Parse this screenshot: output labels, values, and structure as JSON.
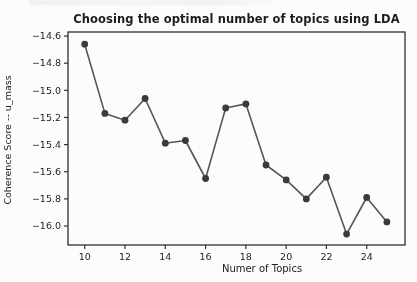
{
  "chart_data": {
    "type": "line",
    "title": "Choosing the optimal number of topics using LDA",
    "xlabel": "Numer of Topics",
    "ylabel": "Coherence Score -- u_mass",
    "x": [
      10,
      11,
      12,
      13,
      14,
      15,
      16,
      17,
      18,
      19,
      20,
      21,
      22,
      23,
      24,
      25
    ],
    "values": [
      -14.66,
      -15.17,
      -15.22,
      -15.06,
      -15.39,
      -15.37,
      -15.65,
      -15.13,
      -15.1,
      -15.55,
      -15.66,
      -15.8,
      -15.64,
      -16.06,
      -15.79,
      -15.97
    ],
    "xticks": [
      10,
      12,
      14,
      16,
      18,
      20,
      22,
      24
    ],
    "yticks": [
      -14.6,
      -14.8,
      -15.0,
      -15.2,
      -15.4,
      -15.6,
      -15.8,
      -16.0
    ],
    "xlim": [
      9.17,
      25.9
    ],
    "ylim": [
      -16.14,
      -14.57
    ],
    "grid": false,
    "legend": null,
    "line_color": "#565656",
    "marker_color": "#3a3a3a",
    "spine_color": "#2f2f2f",
    "tick_text_color": "#1f1f1f",
    "background": "#fcfcfb"
  }
}
